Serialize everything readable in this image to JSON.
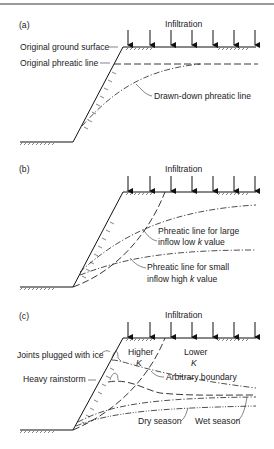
{
  "panels": [
    {
      "label": "(a)",
      "infiltration": "Infiltration",
      "annotations": {
        "ground_surface": "Original ground surface",
        "phreatic_line": "Original phreatic line",
        "drawn_down": "Drawn-down phreatic line"
      }
    },
    {
      "label": "(b)",
      "infiltration": "Infiltration",
      "annotations": {
        "large_inflow_1": "Phreatic line for large",
        "large_inflow_2": "inflow low",
        "large_inflow_k": "k",
        "large_inflow_3": "value",
        "small_inflow_1": "Phreatic line for small",
        "small_inflow_2": "inflow high",
        "small_inflow_k": "k",
        "small_inflow_3": "value"
      }
    },
    {
      "label": "(c)",
      "infiltration": "Infiltration",
      "annotations": {
        "higher": "Higher",
        "higher_k": "K",
        "lower": "Lower",
        "lower_k": "K",
        "joints": "Joints plugged with ice",
        "arbitrary": "Arbitrary boundary",
        "rainstorm": "Heavy rainstorm",
        "dry": "Dry season",
        "wet": "Wet season"
      }
    }
  ]
}
